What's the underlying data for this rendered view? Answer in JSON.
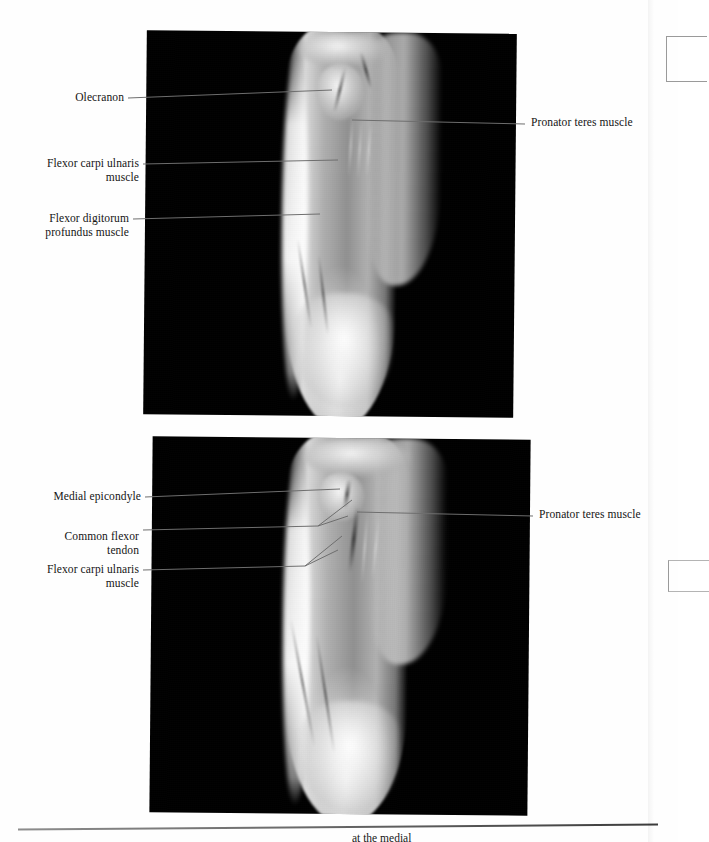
{
  "figure": {
    "type": "anatomical-mri-figure",
    "panel_count": 2,
    "modality": "MRI",
    "region": "elbow and proximal forearm",
    "background_color": "#000000",
    "page_color": "#ffffff",
    "leader_line_color": "#6e6e6e"
  },
  "panels": [
    {
      "id": "top-panel",
      "name": "upper-mri-panel",
      "labels_left": [
        {
          "id": "olecranon",
          "text": "Olecranon"
        },
        {
          "id": "flexor-carpi-ulnaris-muscle",
          "text": "Flexor carpi ulnaris\nmuscle"
        },
        {
          "id": "flexor-digitorum-profundus-muscle",
          "text": "Flexor digitorum\nprofundus muscle"
        }
      ],
      "labels_right": [
        {
          "id": "pronator-teres-muscle",
          "text": "Pronator teres muscle"
        }
      ]
    },
    {
      "id": "bottom-panel",
      "name": "lower-mri-panel",
      "labels_left": [
        {
          "id": "medial-epicondyle",
          "text": "Medial epicondyle"
        },
        {
          "id": "common-flexor-tendon",
          "text": "Common flexor\ntendon"
        },
        {
          "id": "flexor-carpi-ulnaris-muscle-2",
          "text": "Flexor carpi ulnaris\nmuscle"
        }
      ],
      "labels_right": [
        {
          "id": "pronator-teres-muscle-2",
          "text": "Pronator teres muscle"
        }
      ]
    }
  ],
  "caption": {
    "visible_fragment": "at the medial"
  }
}
